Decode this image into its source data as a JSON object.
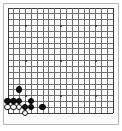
{
  "board": {
    "type": "go-board",
    "size": 19,
    "label": "Go board position",
    "geometry": {
      "origin_x": 7.5,
      "origin_y": 7.5,
      "spacing": 5.85,
      "stone_diameter": 6.6,
      "star_radius": 1
    },
    "colors": {
      "background": "#fdfdfd",
      "line": "#6e6e6e",
      "edge_line": "#3a3a3a",
      "frame": "#b5b5b5",
      "black_stone": "#111111",
      "white_stone": "#ffffff",
      "white_stone_outline": "#111111",
      "star_point": "#2b2b2b"
    },
    "star_points": [
      {
        "col": 4,
        "row": 4
      },
      {
        "col": 10,
        "row": 4
      },
      {
        "col": 16,
        "row": 4
      },
      {
        "col": 4,
        "row": 10
      },
      {
        "col": 10,
        "row": 10
      },
      {
        "col": 16,
        "row": 10
      },
      {
        "col": 4,
        "row": 16
      },
      {
        "col": 10,
        "row": 16
      },
      {
        "col": 16,
        "row": 16
      }
    ],
    "stones": [
      {
        "color": "black",
        "col": 3,
        "row": 15,
        "name": "black-stone-c15"
      },
      {
        "color": "black",
        "col": 1,
        "row": 17,
        "name": "black-stone-a17"
      },
      {
        "color": "black",
        "col": 2,
        "row": 17,
        "name": "black-stone-b17"
      },
      {
        "color": "black",
        "col": 3,
        "row": 17,
        "name": "black-stone-c17"
      },
      {
        "color": "white",
        "col": 1,
        "row": 18,
        "name": "white-stone-a18"
      },
      {
        "color": "white",
        "col": 2,
        "row": 18,
        "name": "white-stone-b18"
      },
      {
        "color": "white",
        "col": 3,
        "row": 18,
        "name": "white-stone-c18"
      },
      {
        "color": "black",
        "col": 5,
        "row": 17,
        "name": "black-stone-e17"
      },
      {
        "color": "black",
        "col": 4,
        "row": 18,
        "name": "black-stone-d18"
      },
      {
        "color": "black",
        "col": 5,
        "row": 18,
        "name": "black-stone-e18"
      },
      {
        "color": "white",
        "col": 4,
        "row": 19,
        "name": "white-stone-d19"
      },
      {
        "color": "black",
        "col": 7,
        "row": 18,
        "name": "black-stone-g18"
      }
    ],
    "counts": {
      "black_stones": 8,
      "white_stones": 4,
      "total_stones": 12
    }
  }
}
